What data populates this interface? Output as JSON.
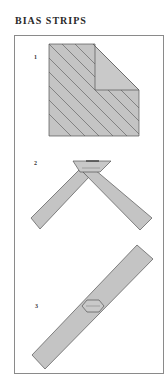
{
  "title": "BIAS STRIPS",
  "colors": {
    "fill": "#c4c4c4",
    "stroke": "#555555",
    "frame": "#8a8a8a"
  },
  "steps": [
    {
      "number": "1",
      "description": "square fabric folded diagonally with bias lines"
    },
    {
      "number": "2",
      "description": "two bias strips joined at right angle"
    },
    {
      "number": "3",
      "description": "joined continuous bias strip with seam"
    }
  ]
}
